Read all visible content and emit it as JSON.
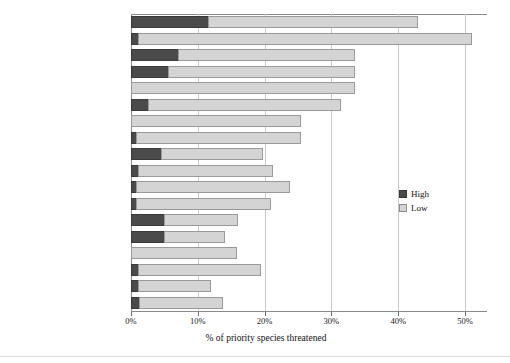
{
  "chart_data": {
    "type": "bar",
    "orientation": "horizontal",
    "stacked": true,
    "title": "",
    "xlabel": "% of priority species threatened",
    "ylabel": "",
    "xlim": [
      0,
      53
    ],
    "xticks": [
      0,
      10,
      20,
      30,
      40,
      50
    ],
    "xtick_labels": [
      "0%",
      "10%",
      "20%",
      "30%",
      "40%",
      "50%"
    ],
    "grid": true,
    "grid_axis": "x",
    "legend_position": "right-middle",
    "categories": [
      "1. Land abandonment",
      "2. Frequent, large fires",
      "3. Afforestation",
      "4. Human disturbance",
      "5. Lack of fire",
      "6. Wood-cutting",
      "7. Reservoir construction",
      "8. Urbanization",
      "9. Roads, railways, etc",
      "10. Perennial crops",
      "11. Overgrazing",
      "12. Tree disease",
      "13. Powerlines",
      "14. Habitat fragmentation",
      "15. Arable agriculture",
      "16. Shrub removal",
      "17. Pesticides",
      "18. Mining and quarrying"
    ],
    "series": [
      {
        "name": "High",
        "color": "#4a4a4a",
        "values": [
          11.5,
          1.0,
          7.0,
          5.5,
          0.0,
          2.5,
          0.0,
          0.8,
          4.5,
          1.0,
          0.8,
          0.8,
          5.0,
          5.0,
          0.0,
          1.0,
          1.0,
          1.2
        ]
      },
      {
        "name": "Low",
        "color": "#d4d4d4",
        "values": [
          31.5,
          50.0,
          26.5,
          28.0,
          33.5,
          29.0,
          25.5,
          24.7,
          15.3,
          20.2,
          23.0,
          20.2,
          11.0,
          9.0,
          15.8,
          18.5,
          11.0,
          12.5
        ]
      }
    ],
    "totals": [
      43.0,
      51.0,
      33.5,
      33.5,
      33.5,
      31.5,
      25.5,
      25.5,
      19.8,
      21.2,
      23.8,
      21.0,
      16.0,
      14.0,
      15.8,
      19.5,
      12.0,
      13.7
    ]
  },
  "legend": {
    "entries": [
      {
        "label": "High",
        "swatch": "high-swatch"
      },
      {
        "label": "Low",
        "swatch": "low-swatch"
      }
    ]
  }
}
